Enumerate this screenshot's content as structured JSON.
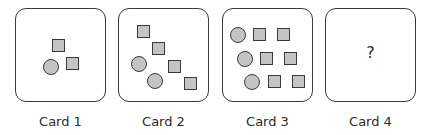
{
  "cards": [
    {
      "label": "Card 1",
      "content": "1 circle, 2 squares"
    },
    {
      "label": "Card 2",
      "content": "2 circles, 4 squares"
    },
    {
      "label": "Card 3",
      "content": "3 circles, 6 squares"
    },
    {
      "label": "Card 4",
      "content": "?"
    }
  ],
  "colors": {
    "shape_fill": "#c4c4c4",
    "outline": "#3a3a3a",
    "text": "#2a2a2a"
  }
}
